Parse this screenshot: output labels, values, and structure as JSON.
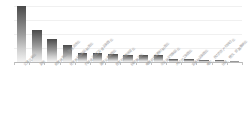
{
  "chart_data": {
    "type": "bar",
    "title": "",
    "subtitle": "",
    "xlabel": "",
    "ylabel": "",
    "grid": true,
    "legend": "none",
    "orientation": "vertical",
    "sorted": "descending",
    "ylim": [
      0,
      100
    ],
    "categories": [
      "交通运输业",
      "其他",
      "房屋建筑业、装修装饰业",
      "化学原料及制品制造业",
      "农副食品加工及食品制造业",
      "通用设备制造业",
      "批发和零售贸易业",
      "纺织服装业",
      "电器机械及器材制造业",
      "非金属矿物制品业",
      "木材加工制造业",
      "金属制品制造业",
      "电力、热力的生产和供应业",
      "住宿、餐饮、旅游服务业"
    ],
    "values": [
      94,
      53,
      39,
      28,
      15,
      15,
      14,
      11,
      12,
      12,
      5,
      5,
      3,
      3
    ],
    "bar_count": 15
  },
  "style": {
    "bar_top_color": "#4a4a4a",
    "bar_bottom_color": "#f3f3f3",
    "axis_color": "#b9b9b9",
    "grid_color": "#f0f0f0",
    "label_color": "#9d9d9d",
    "background": "#ffffff"
  }
}
